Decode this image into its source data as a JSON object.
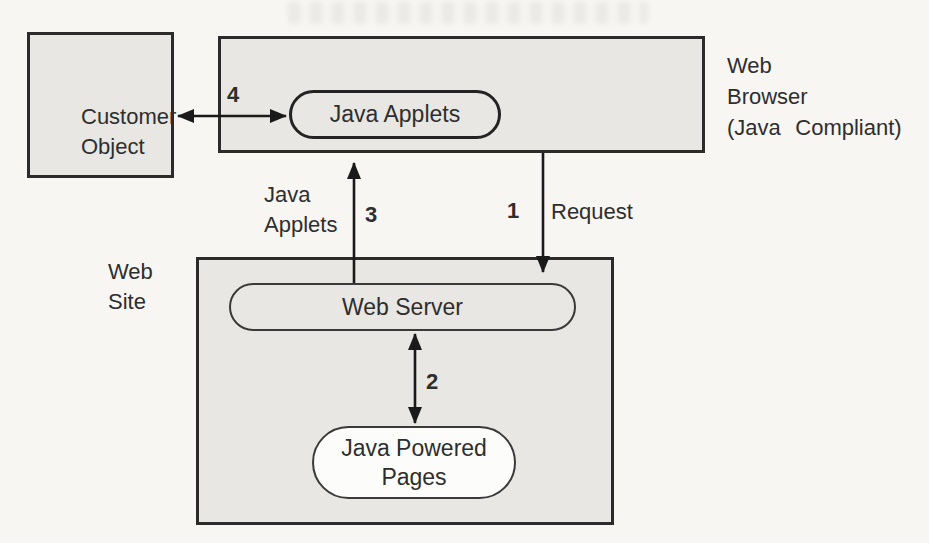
{
  "figure": {
    "type": "architecture-diagram",
    "topic": "Java applets between web browser and web site"
  },
  "colors": {
    "background": "#f7f6f3",
    "box_fill": "#e8e7e3",
    "box_border": "#2b2b2b",
    "arrow": "#1a1a1a",
    "pages_pill_fill": "#fcfcfa"
  },
  "nodes": {
    "customer_object": {
      "line1": "Customer",
      "line2": "Object"
    },
    "java_applets_pill": {
      "label": "Java Applets"
    },
    "web_browser_label": {
      "line1": "Web",
      "line2": "Browser",
      "line3": "(Java Compliant)"
    },
    "web_site_label": {
      "line1": "Web",
      "line2": "Site"
    },
    "web_server_pill": {
      "label": "Web Server"
    },
    "java_powered_pages_pill": {
      "line1": "Java Powered",
      "line2": "Pages"
    }
  },
  "arrows": {
    "request_down": {
      "number": "1",
      "label": "Request"
    },
    "server_to_pages": {
      "number": "2"
    },
    "applets_up": {
      "number": "3",
      "label_line1": "Java",
      "label_line2": "Applets"
    },
    "customer_to_applets": {
      "number": "4"
    }
  }
}
